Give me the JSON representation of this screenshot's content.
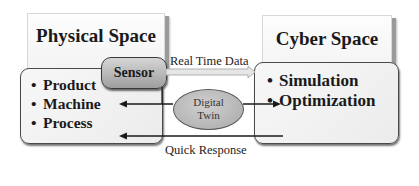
{
  "diagram": {
    "physical": {
      "title": "Physical Space",
      "sensor_label": "Sensor",
      "items": [
        {
          "bullet": "•",
          "label": "Product"
        },
        {
          "bullet": "•",
          "label": "Machine"
        },
        {
          "bullet": "•",
          "label": "Process"
        }
      ]
    },
    "cyber": {
      "title": "Cyber Space",
      "items": [
        {
          "bullet": "•",
          "label": "Simulation"
        },
        {
          "bullet": "•",
          "label": "Optimization"
        }
      ]
    },
    "center": {
      "twin_line1": "Digital",
      "twin_line2": "Twin"
    },
    "connections": {
      "top_label": "Real Time Data",
      "bottom_label": "Quick Response"
    },
    "colors": {
      "line": "#1a1a1a",
      "hollow_arrow": "#c8c8c8",
      "sensor_fill": "#b5b5b5",
      "twin_fill": "#bcbcbc"
    }
  }
}
